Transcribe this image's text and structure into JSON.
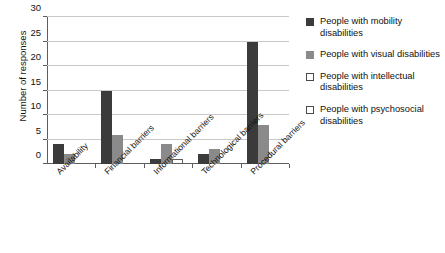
{
  "chart_data": {
    "type": "bar",
    "title": "",
    "xlabel": "",
    "ylabel": "Number of responses",
    "ylim": [
      0,
      30
    ],
    "yticks": [
      0,
      5,
      10,
      15,
      20,
      25,
      30
    ],
    "grid": true,
    "legend_position": "right",
    "categories": [
      "Availability",
      "Financial barriers",
      "Informational barriers",
      "Technological barriers",
      "Procedural barriers"
    ],
    "series": [
      {
        "name": "People with mobility disabilities",
        "color": "#3b3b3b",
        "values": [
          4,
          15,
          1,
          2,
          25
        ]
      },
      {
        "name": "People with visual disabilities",
        "color": "#8a8a8a",
        "values": [
          2,
          6,
          4,
          3,
          8
        ]
      },
      {
        "name": "People with intellectual disabilities",
        "color": "#ffffff",
        "values": [
          0,
          0,
          1,
          0,
          0
        ]
      },
      {
        "name": "People with psychosocial disabilities",
        "color": "#ffffff",
        "values": [
          0,
          0,
          0,
          0,
          0
        ]
      }
    ]
  },
  "axis": {
    "y_title": "Number of responses",
    "y_tick_labels": [
      "0",
      "5",
      "10",
      "15",
      "20",
      "25",
      "30"
    ],
    "x_tick_labels": [
      "Availability",
      "Financial barriers",
      "Informational barriers",
      "Technological barriers",
      "Procedural barriers"
    ]
  },
  "legend": {
    "items": [
      {
        "label": "People with mobility disabilities",
        "swatch": "filled-dark",
        "color": "#3b3b3b"
      },
      {
        "label": "People with visual disabilities",
        "swatch": "filled-gray",
        "color": "#8a8a8a"
      },
      {
        "label": "People with intellectual disabilities",
        "swatch": "outlined-white",
        "color": "#ffffff"
      },
      {
        "label": "People with psychosocial disabilities",
        "swatch": "outlined-white",
        "color": "#ffffff"
      }
    ]
  }
}
